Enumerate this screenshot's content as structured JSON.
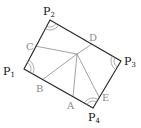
{
  "diagram": {
    "type": "geometry-figure",
    "colors": {
      "rect_stroke": "#222222",
      "inner_stroke": "#8a8a8a",
      "vertex_label": "#111111",
      "point_label": "#8a8a8a"
    },
    "vertices": [
      {
        "id": "P1",
        "letter": "P",
        "sub": "1",
        "x": 24,
        "y": 69
      },
      {
        "id": "P2",
        "letter": "P",
        "sub": "2",
        "x": 50,
        "y": 20
      },
      {
        "id": "P3",
        "letter": "P",
        "sub": "3",
        "x": 121,
        "y": 61
      },
      {
        "id": "P4",
        "letter": "P",
        "sub": "4",
        "x": 93,
        "y": 108
      }
    ],
    "points": [
      {
        "id": "A",
        "label": "A",
        "x": 73,
        "y": 97
      },
      {
        "id": "B",
        "label": "B",
        "x": 42,
        "y": 80
      },
      {
        "id": "C",
        "label": "C",
        "x": 35,
        "y": 46
      },
      {
        "id": "D",
        "label": "D",
        "x": 92,
        "y": 44
      },
      {
        "id": "E",
        "label": "E",
        "x": 99,
        "y": 97
      }
    ],
    "interior_point": {
      "x": 77,
      "y": 54
    },
    "labels": {
      "P1": "P",
      "P1_sub": "1",
      "P2": "P",
      "P2_sub": "2",
      "P3": "P",
      "P3_sub": "3",
      "P4": "P",
      "P4_sub": "4",
      "A": "A",
      "B": "B",
      "C": "C",
      "D": "D",
      "E": "E"
    },
    "angle_marks": [
      "P1",
      "P2",
      "P3",
      "P4"
    ]
  }
}
